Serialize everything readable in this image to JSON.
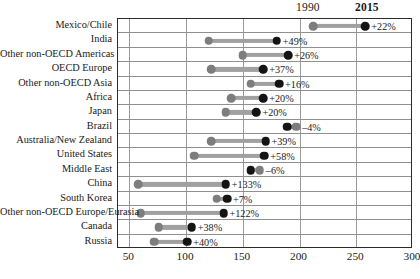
{
  "header": {
    "year_left_label": "1990",
    "year_right_label": "2015"
  },
  "axis": {
    "ticks": [
      "50",
      "100",
      "150",
      "200",
      "250",
      "300"
    ],
    "tick_values": [
      50,
      100,
      150,
      200,
      250,
      300
    ],
    "min": 40,
    "max": 300
  },
  "colors": {
    "dot_1990": "#7d7d7d",
    "dot_2015": "#141414",
    "connector": "#a0a0a0",
    "frame": "#2b2b2b",
    "gridline": "#9a9a9a"
  },
  "chart_data": {
    "type": "scatter",
    "subtype": "dumbbell",
    "title": "",
    "xlabel": "",
    "ylabel": "",
    "xlim": [
      40,
      300
    ],
    "grid": true,
    "legend_position": "top",
    "series": [
      {
        "name": "1990",
        "values": [
          212,
          120,
          150,
          122,
          157,
          140,
          135,
          197,
          122,
          107,
          165,
          58,
          127,
          60,
          76,
          72
        ]
      },
      {
        "name": "2015",
        "values": [
          258,
          180,
          190,
          168,
          182,
          168,
          162,
          189,
          170,
          169,
          157,
          135,
          136,
          133,
          105,
          101
        ]
      }
    ],
    "categories": [
      "Mexico/Chile",
      "India",
      "Other non-OECD Americas",
      "OECD Europe",
      "Other non-OECD Asia",
      "Africa",
      "Japan",
      "Brazil",
      "Australia/New Zealand",
      "United States",
      "Middle East",
      "China",
      "South Korea",
      "Other non-OECD Europe/Eurasia",
      "Canada",
      "Russia"
    ],
    "annotations": [
      "+22%",
      "+49%",
      "+26%",
      "+37%",
      "+16%",
      "+20%",
      "+20%",
      "–4%",
      "+39%",
      "+58%",
      "–6%",
      "+133%",
      "+7%",
      "+122%",
      "+38%",
      "+40%"
    ],
    "rows": [
      {
        "label": "Mexico/Chile",
        "v1990": 212,
        "v2015": 258,
        "change": "+22%"
      },
      {
        "label": "India",
        "v1990": 120,
        "v2015": 180,
        "change": "+49%"
      },
      {
        "label": "Other non-OECD Americas",
        "v1990": 150,
        "v2015": 190,
        "change": "+26%"
      },
      {
        "label": "OECD Europe",
        "v1990": 122,
        "v2015": 168,
        "change": "+37%"
      },
      {
        "label": "Other non-OECD Asia",
        "v1990": 157,
        "v2015": 182,
        "change": "+16%"
      },
      {
        "label": "Africa",
        "v1990": 140,
        "v2015": 168,
        "change": "+20%"
      },
      {
        "label": "Japan",
        "v1990": 135,
        "v2015": 162,
        "change": "+20%"
      },
      {
        "label": "Brazil",
        "v1990": 197,
        "v2015": 189,
        "change": "–4%"
      },
      {
        "label": "Australia/New Zealand",
        "v1990": 122,
        "v2015": 170,
        "change": "+39%"
      },
      {
        "label": "United States",
        "v1990": 107,
        "v2015": 169,
        "change": "+58%"
      },
      {
        "label": "Middle East",
        "v1990": 165,
        "v2015": 157,
        "change": "–6%"
      },
      {
        "label": "China",
        "v1990": 58,
        "v2015": 135,
        "change": "+133%"
      },
      {
        "label": "South Korea",
        "v1990": 127,
        "v2015": 136,
        "change": "+7%"
      },
      {
        "label": "Other non-OECD Europe/Eurasia",
        "v1990": 60,
        "v2015": 133,
        "change": "+122%"
      },
      {
        "label": "Canada",
        "v1990": 76,
        "v2015": 105,
        "change": "+38%"
      },
      {
        "label": "Russia",
        "v1990": 72,
        "v2015": 101,
        "change": "+40%"
      }
    ]
  }
}
